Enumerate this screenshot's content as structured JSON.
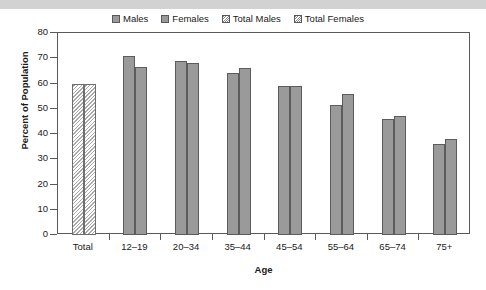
{
  "chart_data": {
    "type": "bar",
    "title": "",
    "xlabel": "Age",
    "ylabel": "Percent of Population",
    "ylim": [
      0,
      80
    ],
    "yticks": [
      0,
      10,
      20,
      30,
      40,
      50,
      60,
      70,
      80
    ],
    "grid": false,
    "legend_position": "top",
    "categories": [
      "Total",
      "12–19",
      "20–34",
      "35–44",
      "45–54",
      "55–64",
      "65–74",
      "75+"
    ],
    "series": [
      {
        "name": "Males",
        "style": "solid",
        "color": "#9a9a9a",
        "values": [
          null,
          71,
          69,
          64,
          59,
          51.5,
          46,
          36
        ]
      },
      {
        "name": "Females",
        "style": "solid",
        "color": "#9a9a9a",
        "values": [
          null,
          66.5,
          68,
          66,
          59,
          56,
          47,
          38
        ]
      },
      {
        "name": "Total Males",
        "style": "hatched",
        "color": "#ffffff",
        "values": [
          60,
          null,
          null,
          null,
          null,
          null,
          null,
          null
        ]
      },
      {
        "name": "Total Females",
        "style": "hatched",
        "color": "#ffffff",
        "values": [
          60,
          null,
          null,
          null,
          null,
          null,
          null,
          null
        ]
      }
    ]
  },
  "legend": {
    "items": [
      {
        "label": "Males",
        "swatch": "solid"
      },
      {
        "label": "Females",
        "swatch": "solid"
      },
      {
        "label": "Total Males",
        "swatch": "hatch"
      },
      {
        "label": "Total Females",
        "swatch": "hatch"
      }
    ]
  },
  "axes": {
    "y_title": "Percent of Population",
    "x_title": "Age",
    "y_ticks": [
      "80",
      "70",
      "60",
      "50",
      "40",
      "30",
      "20",
      "10",
      "0"
    ],
    "x_categories": [
      "Total",
      "12–19",
      "20–34",
      "35–44",
      "45–54",
      "55–64",
      "65–74",
      "75+"
    ]
  }
}
